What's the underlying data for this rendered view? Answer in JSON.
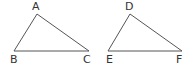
{
  "diagram": {
    "width": 186,
    "height": 69,
    "stroke_color": "#555555",
    "label_color": "#333333",
    "triangles": [
      {
        "name": "ABC",
        "vertices": [
          {
            "label": "A",
            "x": 37,
            "y": 14,
            "lx": 35,
            "ly": 10
          },
          {
            "label": "B",
            "x": 14,
            "y": 51,
            "lx": 13,
            "ly": 63
          },
          {
            "label": "C",
            "x": 89,
            "y": 51,
            "lx": 86,
            "ly": 63
          }
        ]
      },
      {
        "name": "DEF",
        "vertices": [
          {
            "label": "D",
            "x": 130,
            "y": 14,
            "lx": 128,
            "ly": 10
          },
          {
            "label": "E",
            "x": 108,
            "y": 51,
            "lx": 109,
            "ly": 63
          },
          {
            "label": "F",
            "x": 182,
            "y": 51,
            "lx": 179,
            "ly": 63
          }
        ]
      }
    ]
  }
}
